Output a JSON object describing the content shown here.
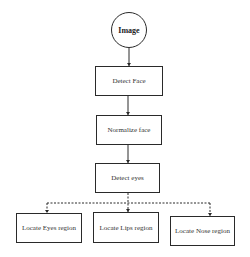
{
  "diagram": {
    "type": "flowchart",
    "nodes": {
      "start": {
        "label": "Image",
        "shape": "circle"
      },
      "detect_face": {
        "label": "Detect Face",
        "shape": "rectangle"
      },
      "normalize_face": {
        "label": "Normalize face",
        "shape": "rectangle"
      },
      "detect_eyes": {
        "label": "Detect eyes",
        "shape": "rectangle"
      },
      "locate_eyes": {
        "label": "Locate Eyes region",
        "shape": "rectangle"
      },
      "locate_lips": {
        "label": "Locate Lips region",
        "shape": "rectangle"
      },
      "locate_nose": {
        "label": "Locate Nose region",
        "shape": "rectangle"
      }
    },
    "edges": [
      {
        "from": "start",
        "to": "detect_face",
        "style": "solid"
      },
      {
        "from": "detect_face",
        "to": "normalize_face",
        "style": "solid"
      },
      {
        "from": "normalize_face",
        "to": "detect_eyes",
        "style": "solid"
      },
      {
        "from": "detect_eyes",
        "to": "locate_eyes",
        "style": "dashed"
      },
      {
        "from": "detect_eyes",
        "to": "locate_lips",
        "style": "dashed"
      },
      {
        "from": "detect_eyes",
        "to": "locate_nose",
        "style": "dashed"
      }
    ],
    "colors": {
      "stroke": "#2a2a2a",
      "background": "#ffffff"
    }
  }
}
